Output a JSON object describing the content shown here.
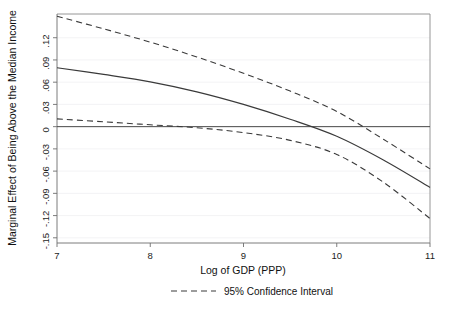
{
  "chart_data": {
    "type": "line",
    "title": "",
    "xlabel": "Log of GDP (PPP)",
    "ylabel": "Marginal Effect of Being Above the Median Income",
    "xlim": [
      7,
      11
    ],
    "ylim": [
      -0.157,
      0.152
    ],
    "xticks": [
      7,
      8,
      9,
      10,
      11
    ],
    "xtick_labels": [
      "7",
      "8",
      "9",
      "10",
      "11"
    ],
    "yticks": [
      0.12,
      0.09,
      0.06,
      0.03,
      0,
      -0.03,
      -0.06,
      -0.09,
      -0.12,
      -0.15
    ],
    "ytick_labels": [
      ".12",
      ".09",
      ".06",
      ".03",
      "0",
      "-.03",
      "-.06",
      "-.09",
      "-.12",
      "-.15"
    ],
    "grid": true,
    "legend_position": "below-axis",
    "legend": [
      {
        "name": "95% Confidence Interval",
        "style": "dashed"
      }
    ],
    "reference_lines": [
      {
        "name": "zero-line",
        "orientation": "horizontal",
        "value": 0,
        "style": "solid"
      }
    ],
    "x": [
      7.0,
      7.5,
      8.0,
      8.5,
      9.0,
      9.5,
      10.0,
      10.5,
      11.0
    ],
    "series": [
      {
        "name": "Marginal effect (point estimate)",
        "style": "solid",
        "values": [
          0.0795,
          0.0705,
          0.0605,
          0.047,
          0.03,
          0.01,
          -0.013,
          -0.045,
          -0.082
        ]
      },
      {
        "name": "Upper 95% confidence bound",
        "style": "dashed",
        "values": [
          0.149,
          0.132,
          0.114,
          0.094,
          0.072,
          0.048,
          0.0205,
          -0.017,
          -0.057
        ]
      },
      {
        "name": "Lower 95% confidence bound",
        "style": "dashed",
        "values": [
          0.0105,
          0.0065,
          0.0025,
          -0.0015,
          -0.008,
          -0.0185,
          -0.0375,
          -0.075,
          -0.124
        ]
      }
    ]
  },
  "axis": {
    "x_title": "Log of GDP (PPP)",
    "y_title": "Marginal Effect of Being Above the Median Income"
  },
  "legend": {
    "ci_label": "95% Confidence Interval"
  }
}
